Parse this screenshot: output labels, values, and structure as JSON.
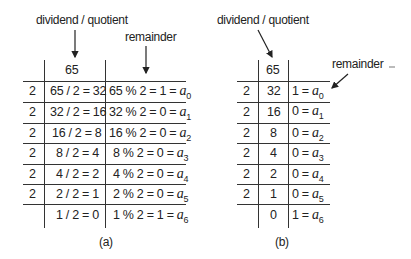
{
  "figure_a": {
    "label_dividend": "dividend / quotient",
    "label_remainder": "remainder",
    "header_value": "65",
    "caption": "(a)",
    "rows": [
      {
        "divisor": "2",
        "quotient": "65 / 2 = 32",
        "rem_expr": "65 % 2 = 1 = ",
        "rem_var": "a",
        "rem_sub": "0"
      },
      {
        "divisor": "2",
        "quotient": "32 / 2 = 16",
        "rem_expr": "32 % 2 = 0 = ",
        "rem_var": "a",
        "rem_sub": "1"
      },
      {
        "divisor": "2",
        "quotient": "16 / 2 = 8",
        "rem_expr": "16 % 2 = 0 = ",
        "rem_var": "a",
        "rem_sub": "2"
      },
      {
        "divisor": "2",
        "quotient": "8 / 2 = 4",
        "rem_expr": "8 % 2 = 0 = ",
        "rem_var": "a",
        "rem_sub": "3"
      },
      {
        "divisor": "2",
        "quotient": "4 / 2 = 2",
        "rem_expr": "4 % 2 = 0 = ",
        "rem_var": "a",
        "rem_sub": "4"
      },
      {
        "divisor": "2",
        "quotient": "2 / 2 = 1",
        "rem_expr": "2 % 2 = 0 = ",
        "rem_var": "a",
        "rem_sub": "5"
      },
      {
        "divisor": "",
        "quotient": "1 / 2 = 0",
        "rem_expr": "1 % 2 = 1 = ",
        "rem_var": "a",
        "rem_sub": "6"
      }
    ]
  },
  "figure_b": {
    "label_dividend": "dividend / quotient",
    "label_remainder": "remainder",
    "header_value": "65",
    "caption": "(b)",
    "rows": [
      {
        "divisor": "2",
        "quotient": "32",
        "rem_expr": "1 = ",
        "rem_var": "a",
        "rem_sub": "0"
      },
      {
        "divisor": "2",
        "quotient": "16",
        "rem_expr": "0 = ",
        "rem_var": "a",
        "rem_sub": "1"
      },
      {
        "divisor": "2",
        "quotient": "8",
        "rem_expr": "0 = ",
        "rem_var": "a",
        "rem_sub": "2"
      },
      {
        "divisor": "2",
        "quotient": "4",
        "rem_expr": "0 = ",
        "rem_var": "a",
        "rem_sub": "3"
      },
      {
        "divisor": "2",
        "quotient": "2",
        "rem_expr": "0 = ",
        "rem_var": "a",
        "rem_sub": "4"
      },
      {
        "divisor": "2",
        "quotient": "1",
        "rem_expr": "0 = ",
        "rem_var": "a",
        "rem_sub": "5"
      },
      {
        "divisor": "",
        "quotient": "0",
        "rem_expr": "1 = ",
        "rem_var": "a",
        "rem_sub": "6"
      }
    ]
  }
}
